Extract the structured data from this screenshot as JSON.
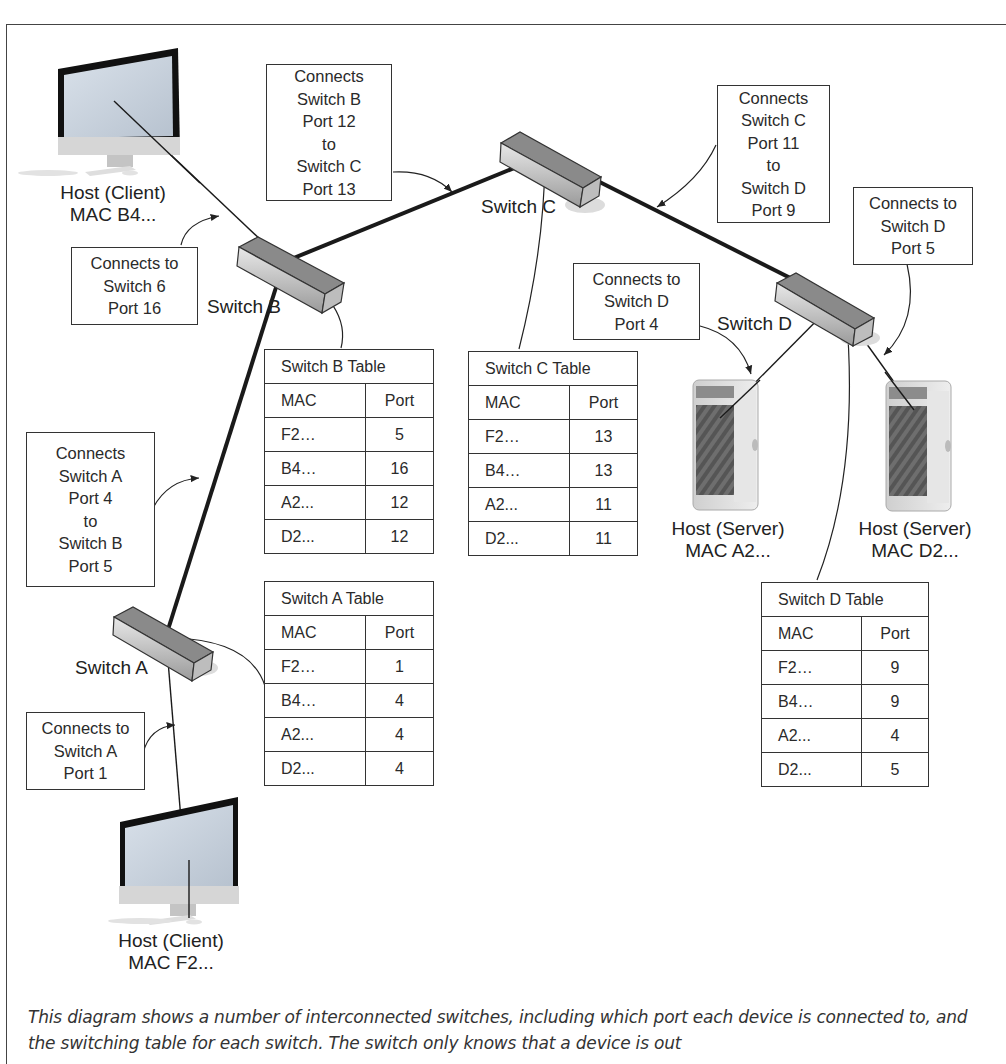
{
  "diagram": {
    "hosts": [
      {
        "id": "client_b4",
        "role": "Host (Client)",
        "mac": "MAC B4...",
        "kind": "imac"
      },
      {
        "id": "client_f2",
        "role": "Host (Client)",
        "mac": "MAC F2...",
        "kind": "imac"
      },
      {
        "id": "server_a2",
        "role": "Host (Server)",
        "mac": "MAC A2...",
        "kind": "tower"
      },
      {
        "id": "server_d2",
        "role": "Host (Server)",
        "mac": "MAC D2...",
        "kind": "tower"
      }
    ],
    "switches": [
      {
        "id": "A",
        "label": "Switch A"
      },
      {
        "id": "B",
        "label": "Switch B"
      },
      {
        "id": "C",
        "label": "Switch C"
      },
      {
        "id": "D",
        "label": "Switch D"
      }
    ],
    "callouts": [
      {
        "id": "b_to_c",
        "lines": [
          "Connects",
          "Switch B",
          "Port 12",
          "to",
          "Switch C",
          "Port 13"
        ]
      },
      {
        "id": "c_to_d",
        "lines": [
          "Connects",
          "Switch C",
          "Port 11",
          "to",
          "Switch D",
          "Port 9"
        ]
      },
      {
        "id": "d_port5",
        "lines": [
          "Connects to",
          "Switch D",
          "Port 5"
        ]
      },
      {
        "id": "d_port4",
        "lines": [
          "Connects to",
          "Switch D",
          "Port 4"
        ]
      },
      {
        "id": "b_port16",
        "lines": [
          "Connects to",
          "Switch 6",
          "Port 16"
        ]
      },
      {
        "id": "a_to_b",
        "lines": [
          "Connects",
          "Switch A",
          "Port 4",
          "to",
          "Switch B",
          "Port 5"
        ]
      },
      {
        "id": "a_port1",
        "lines": [
          "Connects to",
          "Switch A",
          "Port 1"
        ]
      }
    ],
    "tables": [
      {
        "id": "B",
        "title": "Switch B Table",
        "headers": [
          "MAC",
          "Port"
        ],
        "rows": [
          [
            "F2…",
            "5"
          ],
          [
            "B4…",
            "16"
          ],
          [
            "A2...",
            "12"
          ],
          [
            "D2...",
            "12"
          ]
        ]
      },
      {
        "id": "C",
        "title": "Switch C Table",
        "headers": [
          "MAC",
          "Port"
        ],
        "rows": [
          [
            "F2…",
            "13"
          ],
          [
            "B4…",
            "13"
          ],
          [
            "A2...",
            "11"
          ],
          [
            "D2...",
            "11"
          ]
        ]
      },
      {
        "id": "A",
        "title": "Switch A Table",
        "headers": [
          "MAC",
          "Port"
        ],
        "rows": [
          [
            "F2…",
            "1"
          ],
          [
            "B4…",
            "4"
          ],
          [
            "A2...",
            "4"
          ],
          [
            "D2...",
            "4"
          ]
        ]
      },
      {
        "id": "D",
        "title": "Switch D Table",
        "headers": [
          "MAC",
          "Port"
        ],
        "rows": [
          [
            "F2…",
            "9"
          ],
          [
            "B4…",
            "9"
          ],
          [
            "A2...",
            "4"
          ],
          [
            "D2...",
            "5"
          ]
        ]
      }
    ],
    "caption": "This diagram shows a number of interconnected switches, including which port each device is connected to, and the switching table for each switch. The switch only knows that a device is out"
  }
}
